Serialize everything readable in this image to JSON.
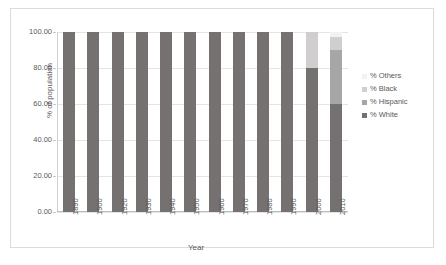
{
  "chart_data": {
    "type": "bar",
    "subtype": "stacked-column",
    "title": "",
    "xlabel": "Year",
    "ylabel": "% of population",
    "ylim": [
      0,
      100
    ],
    "yticks": [
      "0.00",
      "20.00",
      "40.00",
      "60.00",
      "80.00",
      "100.00"
    ],
    "ytick_values": [
      0,
      20,
      40,
      60,
      80,
      100
    ],
    "grid": true,
    "legend_position": "right",
    "categories": [
      "1890",
      "1900",
      "1920",
      "1930",
      "1940",
      "1950",
      "1960",
      "1970",
      "1980",
      "1990",
      "2000",
      "2010"
    ],
    "series": [
      {
        "name": "% White",
        "color": "#767171",
        "values": [
          100,
          100,
          100,
          100,
          100,
          100,
          100,
          100,
          100,
          100,
          80,
          60
        ]
      },
      {
        "name": "% Hispanic",
        "color": "#a6a6a6",
        "values": [
          0,
          0,
          0,
          0,
          0,
          0,
          0,
          0,
          0,
          0,
          0,
          30
        ]
      },
      {
        "name": "% Black",
        "color": "#d0cece",
        "values": [
          0,
          0,
          0,
          0,
          0,
          0,
          0,
          0,
          0,
          0,
          20,
          7
        ]
      },
      {
        "name": "% Others",
        "color": "#f2f2f2",
        "values": [
          0,
          0,
          0,
          0,
          0,
          0,
          0,
          0,
          0,
          0,
          0,
          3
        ]
      }
    ],
    "legend_order": [
      "% Others",
      "% Black",
      "% Hispanic",
      "% White"
    ]
  },
  "legend": {
    "items": [
      {
        "label": "% Others",
        "color": "#f2f2f2"
      },
      {
        "label": "% Black",
        "color": "#d0cece"
      },
      {
        "label": "% Hispanic",
        "color": "#a6a6a6"
      },
      {
        "label": "% White",
        "color": "#767171"
      }
    ]
  },
  "axes": {
    "x_title": "Year",
    "y_title": "% of population"
  },
  "colors": {
    "frame": "#dcdcdc",
    "gridline": "#e4e4e4",
    "axis": "#bdbdbd",
    "text": "#595959",
    "background": "#ffffff"
  }
}
